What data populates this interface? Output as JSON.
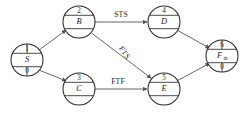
{
  "diagram": {
    "type": "precedence-network-diagram",
    "canvas": {
      "width": 245,
      "height": 113
    },
    "colors": {
      "background": "#ffffff",
      "node_stroke": "#2a2a2a",
      "edge_stroke": "#555555",
      "text": "#1c1c1c"
    },
    "nodes": [
      {
        "key": "S",
        "id": "1",
        "name": "S",
        "sub": "0",
        "bands": 3,
        "cx": 27,
        "cy": 60,
        "r": 16
      },
      {
        "key": "B",
        "id": "2",
        "name": "B",
        "sub": "",
        "bands": 3,
        "cx": 79,
        "cy": 22,
        "r": 16
      },
      {
        "key": "C",
        "id": "3",
        "name": "C",
        "sub": "",
        "bands": 3,
        "cx": 79,
        "cy": 89,
        "r": 16
      },
      {
        "key": "D",
        "id": "4",
        "name": "D",
        "sub": "",
        "bands": 3,
        "cx": 164,
        "cy": 22,
        "r": 16
      },
      {
        "key": "E",
        "id": "5",
        "name": "E",
        "sub": "",
        "bands": 3,
        "cx": 164,
        "cy": 89,
        "r": 16
      },
      {
        "key": "F",
        "id": "6",
        "name": "F",
        "name_sub": "in",
        "sub": "0",
        "bands": 3,
        "cx": 222,
        "cy": 56,
        "r": 16
      }
    ],
    "edges": [
      {
        "from": "S",
        "to": "B",
        "label": ""
      },
      {
        "from": "S",
        "to": "C",
        "label": ""
      },
      {
        "from": "B",
        "to": "D",
        "label": "STS"
      },
      {
        "from": "B",
        "to": "E",
        "label": "FTS"
      },
      {
        "from": "C",
        "to": "E",
        "label": "FTF"
      },
      {
        "from": "D",
        "to": "F",
        "label": ""
      },
      {
        "from": "E",
        "to": "F",
        "label": ""
      }
    ],
    "edge_labels": [
      {
        "key": "STS",
        "text": "STS",
        "x": 121,
        "y": 15,
        "rotate": 0
      },
      {
        "key": "FTS",
        "text": "FTS",
        "x": 124,
        "y": 53,
        "rotate": 56
      },
      {
        "key": "FTF",
        "text": "FTF",
        "x": 118,
        "y": 82,
        "rotate": 0
      }
    ]
  }
}
